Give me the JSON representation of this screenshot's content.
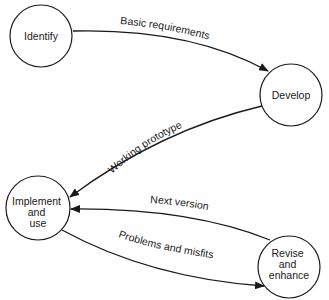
{
  "diagram": {
    "title": "",
    "colors": {
      "stroke": "#1a1a1a",
      "background": "#ffffff"
    },
    "nodes": [
      {
        "id": "identify",
        "label_lines": [
          "Identify"
        ],
        "cx": 41,
        "cy": 36,
        "r": 31
      },
      {
        "id": "develop",
        "label_lines": [
          "Develop"
        ],
        "cx": 291,
        "cy": 95,
        "r": 31
      },
      {
        "id": "implement",
        "label_lines": [
          "Implement",
          "and",
          "use"
        ],
        "cx": 38,
        "cy": 208,
        "r": 32
      },
      {
        "id": "revise",
        "label_lines": [
          "Revise",
          "and",
          "enhance"
        ],
        "cx": 289,
        "cy": 267,
        "r": 31
      }
    ],
    "edges": [
      {
        "id": "basic-requirements",
        "from": "identify",
        "to": "develop",
        "label": "Basic requirements"
      },
      {
        "id": "working-prototype",
        "from": "develop",
        "to": "implement",
        "label": "Working prototype"
      },
      {
        "id": "next-version",
        "from": "revise",
        "to": "implement",
        "label": "Next version"
      },
      {
        "id": "problems-and-misfits",
        "from": "implement",
        "to": "revise",
        "label": "Problems and misfits"
      }
    ]
  }
}
